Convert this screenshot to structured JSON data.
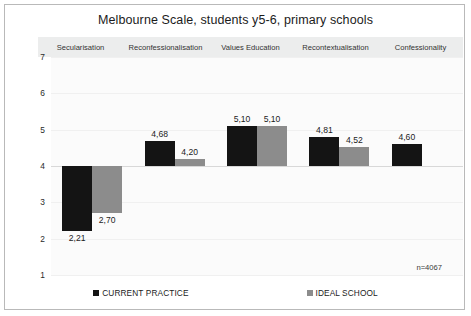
{
  "chart_data": {
    "type": "bar",
    "title": "Melbourne Scale, students y5-6, primary schools",
    "xlabel": "",
    "ylabel": "",
    "ylim": [
      1,
      7
    ],
    "yticks": [
      "7",
      "6",
      "5",
      "4",
      "3",
      "2",
      "1"
    ],
    "baseline": 4,
    "grid": false,
    "legend_position": "bottom",
    "decimal_separator": ",",
    "annotation": "n=4067",
    "categories": [
      "Secularisation",
      "Reconfessionalisation",
      "Values Education",
      "Recontextualisation",
      "Confessionality"
    ],
    "series": [
      {
        "name": "CURRENT PRACTICE",
        "color": "#141414",
        "values": [
          2.21,
          4.68,
          5.1,
          4.81,
          4.6
        ],
        "labels": [
          "2,21",
          "4,68",
          "5,10",
          "4,81",
          "4,60"
        ]
      },
      {
        "name": "IDEAL SCHOOL",
        "color": "#8c8c8c",
        "values": [
          2.7,
          4.2,
          5.1,
          4.52,
          null
        ],
        "labels": [
          "2,70",
          "4,20",
          "5,10",
          "4,52",
          null
        ]
      }
    ]
  },
  "legend": {
    "items": [
      {
        "label": "CURRENT PRACTICE",
        "color": "#141414"
      },
      {
        "label": "IDEAL SCHOOL",
        "color": "#8c8c8c"
      }
    ]
  }
}
